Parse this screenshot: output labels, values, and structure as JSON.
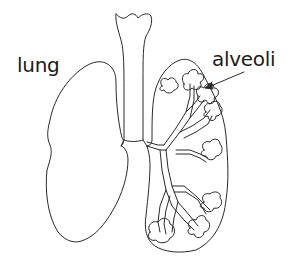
{
  "diagram": {
    "type": "anatomical line drawing",
    "labels": {
      "lung": "lung",
      "alveoli": "alveoli"
    },
    "parts": [
      "trachea",
      "left-lung",
      "right-lung",
      "bronchi",
      "alveoli-clusters"
    ],
    "colors": {
      "stroke": "#2a2a2a",
      "background": "#ffffff",
      "text": "#1a1a1a"
    }
  }
}
